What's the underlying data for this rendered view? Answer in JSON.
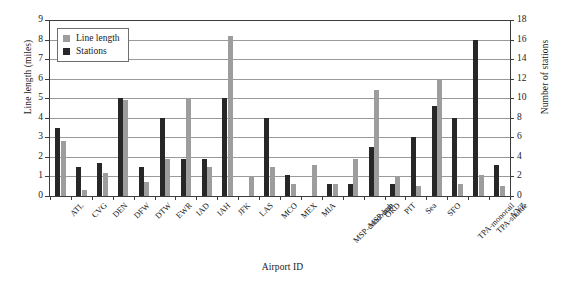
{
  "chart_data": {
    "type": "bar",
    "title": "",
    "xlabel": "Airport ID",
    "ylabel": "Line length (miles)",
    "ylabel_right": "Number of stations",
    "categories": [
      "ATL",
      "CVG",
      "DEN",
      "DFW",
      "DTW",
      "EWR",
      "IAD",
      "IAH",
      "JFK",
      "LAS",
      "MCO",
      "MEX",
      "MIA",
      "MSP-concourse",
      "MSP-hub",
      "ORD",
      "PIT",
      "Sea",
      "SFO",
      "TPA-monorail",
      "TPA-shuttle",
      "YYZ"
    ],
    "series": [
      {
        "name": "Line length",
        "axis": "left",
        "color": "#9d9d9d",
        "values": [
          2.8,
          0.3,
          1.2,
          4.9,
          0.7,
          1.9,
          5.0,
          1.5,
          8.2,
          1.0,
          1.5,
          0.6,
          1.6,
          0.6,
          1.9,
          5.4,
          1.0,
          0.5,
          6.0,
          0.6,
          1.1,
          0.5
        ]
      },
      {
        "name": "Stations",
        "axis": "right",
        "color": "#272727",
        "values": [
          3.5,
          1.5,
          1.7,
          5.0,
          1.5,
          4.0,
          1.9,
          1.9,
          5.0,
          0.0,
          4.0,
          1.1,
          0.0,
          0.6,
          0.6,
          2.5,
          0.6,
          3.0,
          4.6,
          4.0,
          8.0,
          1.6
        ],
        "values_stations": [
          7,
          3,
          3.4,
          10,
          3,
          8,
          3.8,
          3.8,
          10,
          0,
          8,
          2.2,
          0,
          1.2,
          1.2,
          5,
          1.2,
          6,
          9.2,
          8,
          16,
          3.2
        ]
      }
    ],
    "ylim": [
      0,
      9
    ],
    "yticks": [
      0,
      1,
      2,
      3,
      4,
      5,
      6,
      7,
      8,
      9
    ],
    "ylim_right": [
      0,
      18
    ],
    "yticks_right": [
      0,
      2,
      4,
      6,
      8,
      10,
      12,
      14,
      16,
      18
    ],
    "grid": true,
    "legend_position": "upper-left",
    "legend_entries": [
      "Line length",
      "Stations"
    ]
  }
}
